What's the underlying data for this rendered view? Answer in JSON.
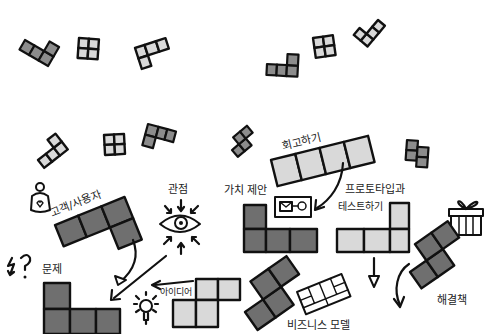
{
  "diagram": {
    "title": "",
    "labels": {
      "perspective": "관점",
      "customer_user": "고객/사용자",
      "problem": "문제",
      "idea": "아이디어",
      "value_proposition": "가치 제안",
      "retrospective": "회고하기",
      "prototype_line1": "프로토타입과",
      "prototype_line2": "테스트하기",
      "solution": "해결책",
      "business_model": "비즈니스 모델"
    },
    "nodes": [
      {
        "id": "customer_user",
        "shape": "L-tetromino",
        "tone": "dark"
      },
      {
        "id": "perspective",
        "shape": "eye-icon",
        "tone": "none"
      },
      {
        "id": "problem",
        "shape": "L-tetromino",
        "tone": "dark"
      },
      {
        "id": "idea",
        "shape": "S-tetromino",
        "tone": "light"
      },
      {
        "id": "value_proposition",
        "shape": "L-tetromino",
        "tone": "dark"
      },
      {
        "id": "retrospective",
        "shape": "I-tetromino",
        "tone": "light"
      },
      {
        "id": "prototype_test",
        "shape": "J-tetromino",
        "tone": "light"
      },
      {
        "id": "solution",
        "shape": "S-tetromino",
        "tone": "dark"
      },
      {
        "id": "business_model",
        "shape": "S-tetromino",
        "tone": "dark"
      }
    ],
    "edges": [
      {
        "from": "customer_user",
        "to": "problem"
      },
      {
        "from": "perspective",
        "to": "problem"
      },
      {
        "from": "idea",
        "to": "problem"
      },
      {
        "from": "retrospective",
        "to": "value_proposition"
      },
      {
        "from": "prototype_test",
        "to": "down"
      },
      {
        "from": "solution",
        "to": "down"
      }
    ],
    "colors": {
      "dark_block": "#6f6f6f",
      "mid_block": "#8c8c8c",
      "light_block": "#d9d9d9",
      "outline": "#111111",
      "background": "#ffffff"
    }
  }
}
